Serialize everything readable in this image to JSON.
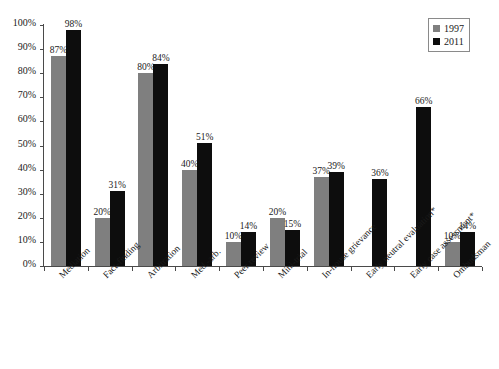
{
  "chart_data": {
    "type": "bar",
    "title": "",
    "subtitle": "",
    "xlabel": "",
    "ylabel": "",
    "ylim": [
      0,
      100
    ],
    "ytick_labels": [
      "0%",
      "10%",
      "20%",
      "30%",
      "40%",
      "50%",
      "60%",
      "70%",
      "80%",
      "90%",
      "100%"
    ],
    "ytick_values": [
      0,
      10,
      20,
      30,
      40,
      50,
      60,
      70,
      80,
      90,
      100
    ],
    "grid": false,
    "legend_position": "top-right",
    "categories": [
      "Mediation",
      "Fact-finding",
      "Arbitration",
      "Med.-arb.",
      "Peer review",
      "Mini-trial",
      "In-house grievance",
      "Early neutral evaluation*",
      "Early case assessment*",
      "Ombudsman"
    ],
    "series": [
      {
        "name": "1997",
        "color": "#7f7f7f",
        "values": [
          87,
          20,
          80,
          40,
          10,
          20,
          37,
          null,
          null,
          10
        ],
        "labels": [
          "87%",
          "20%",
          "80%",
          "40%",
          "10%",
          "20%",
          "37%",
          "",
          "",
          "10%"
        ]
      },
      {
        "name": "2011",
        "color": "#0d0d0d",
        "values": [
          98,
          31,
          84,
          51,
          14,
          15,
          39,
          36,
          66,
          14
        ],
        "labels": [
          "98%",
          "31%",
          "84%",
          "51%",
          "14%",
          "15%",
          "39%",
          "36%",
          "66%",
          "14%"
        ]
      }
    ]
  },
  "legend": {
    "items": [
      {
        "label": "1997",
        "color": "#7f7f7f"
      },
      {
        "label": "2011",
        "color": "#0d0d0d"
      }
    ]
  }
}
